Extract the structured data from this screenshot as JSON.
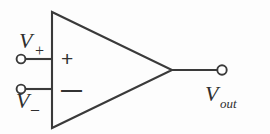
{
  "figure": {
    "background_color": "#fdfdfd",
    "stroke_color": "#3a3a3a",
    "text_color": "#2f2f2f",
    "width": 270,
    "height": 134
  },
  "labels": {
    "v_plus": {
      "base": "V",
      "subscript": "+"
    },
    "v_minus": {
      "base": "V",
      "subscript": "–"
    },
    "v_out": {
      "base": "V",
      "subscript": "out"
    }
  },
  "inner_signs": {
    "non_inverting": "+",
    "inverting": "—"
  },
  "geometry": {
    "triangle": {
      "top_left_x": 52,
      "top_left_y": 12,
      "bottom_left_x": 52,
      "bottom_left_y": 128,
      "apex_x": 172,
      "apex_y": 70
    },
    "input_terminals": [
      {
        "name": "non-inverting",
        "cx": 21,
        "cy": 59,
        "r": 4.5,
        "wire_to_x": 52
      },
      {
        "name": "inverting",
        "cx": 21,
        "cy": 89,
        "r": 4.5,
        "wire_to_x": 52
      }
    ],
    "output_terminal": {
      "cx": 222,
      "cy": 70,
      "r": 5,
      "wire_from_x": 172
    }
  }
}
